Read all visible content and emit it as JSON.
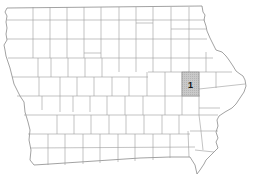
{
  "map": {
    "region": "Iowa",
    "subdivision": "counties",
    "highlighted_counties": [
      {
        "label": "1",
        "fill": "#c4c4c4"
      }
    ],
    "colors": {
      "background": "#ffffff",
      "border": "#9a9a9a",
      "highlight": "#c4c4c4",
      "label": "#111111"
    }
  }
}
